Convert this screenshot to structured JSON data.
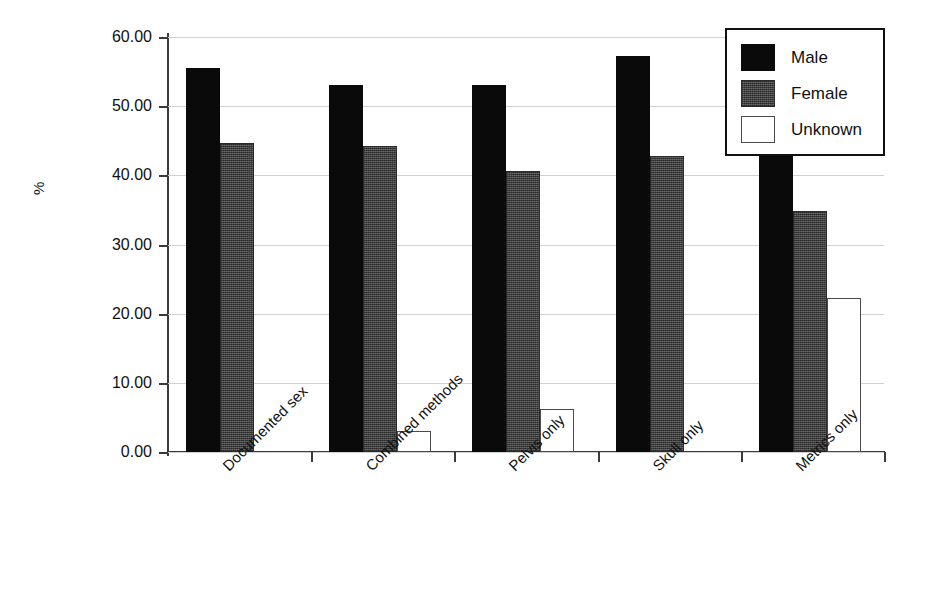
{
  "chart_data": {
    "type": "bar",
    "title": "",
    "xlabel": "",
    "ylabel": "%",
    "ylim": [
      0,
      60
    ],
    "ytick_step": 10,
    "ytick_labels": [
      "0.00",
      "10.00",
      "20.00",
      "30.00",
      "40.00",
      "50.00",
      "60.00"
    ],
    "grid": true,
    "legend_position": "top-right",
    "categories": [
      "Documented sex",
      "Combined methods",
      "Pelvis only",
      "Skull only",
      "Metrics only"
    ],
    "series": [
      {
        "name": "Male",
        "color": "#0a0a0a",
        "values": [
          55.5,
          53.0,
          53.1,
          57.2,
          42.9
        ]
      },
      {
        "name": "Female",
        "color": "#4c4c4c",
        "values": [
          44.7,
          44.2,
          40.6,
          42.8,
          34.9
        ]
      },
      {
        "name": "Unknown",
        "color": "#ffffff",
        "values": [
          0.0,
          3.0,
          6.2,
          0.0,
          22.2
        ]
      }
    ]
  },
  "legend": {
    "items": [
      {
        "label": "Male"
      },
      {
        "label": "Female"
      },
      {
        "label": "Unknown"
      }
    ]
  }
}
